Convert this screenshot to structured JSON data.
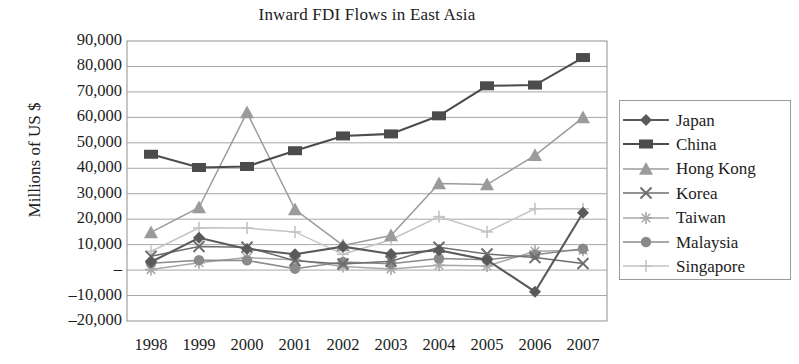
{
  "chart_data": {
    "type": "line",
    "title": "Inward FDI Flows in East Asia",
    "xlabel": "",
    "ylabel": "Millions of US $",
    "grid": true,
    "legend_position": "right",
    "ylim": [
      -20000,
      90000
    ],
    "ytick_step": 10000,
    "ytick_labels": [
      "90,000",
      "80,000",
      "70,000",
      "60,000",
      "50,000",
      "40,000",
      "30,000",
      "20,000",
      "10,000",
      "–",
      "–10,000",
      "–20,000"
    ],
    "ytick_values": [
      90000,
      80000,
      70000,
      60000,
      50000,
      40000,
      30000,
      20000,
      10000,
      0,
      -10000,
      -20000
    ],
    "categories": [
      "1998",
      "1999",
      "2000",
      "2001",
      "2002",
      "2003",
      "2004",
      "2005",
      "2006",
      "2007"
    ],
    "series": [
      {
        "name": "Japan",
        "marker": "diamond",
        "color": "#5a5a5a",
        "values": [
          3200,
          12700,
          8300,
          6200,
          9200,
          6300,
          7800,
          4000,
          -8500,
          22500
        ]
      },
      {
        "name": "China",
        "marker": "square",
        "color": "#4c4c4c",
        "values": [
          45500,
          40300,
          40700,
          46900,
          52700,
          53500,
          60600,
          72400,
          72700,
          83500
        ]
      },
      {
        "name": "Hong Kong",
        "marker": "triangle",
        "color": "#9b9b9b",
        "values": [
          14800,
          24600,
          61900,
          23800,
          9700,
          13600,
          34000,
          33600,
          45100,
          59900
        ]
      },
      {
        "name": "Korea",
        "marker": "cross",
        "color": "#6e6e6e",
        "values": [
          5400,
          9300,
          9000,
          3700,
          2400,
          3500,
          9000,
          6300,
          4900,
          2600
        ]
      },
      {
        "name": "Taiwan",
        "marker": "star",
        "color": "#a8a8a8",
        "values": [
          200,
          2900,
          4900,
          4100,
          1400,
          450,
          1900,
          1600,
          7400,
          7800
        ]
      },
      {
        "name": "Malaysia",
        "marker": "circle",
        "color": "#8a8a8a",
        "values": [
          2700,
          3900,
          3800,
          550,
          3200,
          2500,
          4600,
          4100,
          6000,
          8400
        ]
      },
      {
        "name": "Singapore",
        "marker": "plus",
        "color": "#c4c4c4",
        "values": [
          7300,
          16600,
          16500,
          15000,
          6200,
          11900,
          21000,
          15000,
          24100,
          24100
        ]
      }
    ]
  }
}
